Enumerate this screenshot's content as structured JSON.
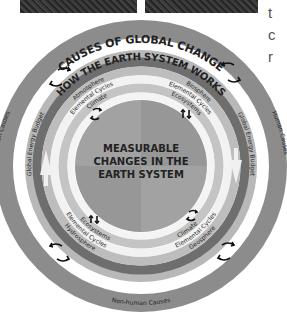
{
  "photos": [
    {
      "name": "photo-left"
    },
    {
      "name": "photo-right"
    }
  ],
  "side_text": [
    "t",
    "c",
    "r"
  ],
  "diagram": {
    "outer_ring_title": "CAUSES OF GLOBAL CHANGE",
    "outer_left": "Human Causes",
    "outer_right": "Human Causes",
    "outer_bottom": "Non-human Causes",
    "middle_title": "HOW THE EARTH SYSTEM WORKS",
    "global_energy_left": "Global Energy Budget",
    "global_energy_right": "Global Energy Budget",
    "sphere_top_left": "Atmosphere",
    "sphere_top_right": "Biosphere",
    "sphere_bottom_left": "Hydrosphere",
    "sphere_bottom_right": "Geosphere",
    "cycles_top_left": "Elemental Cycles",
    "cycles_top_right": "Elemental Cycles",
    "cycles_bottom_left": "Elemental Cycles",
    "cycles_bottom_right": "Elemental Cycles",
    "inner_top_left": "Climate",
    "inner_top_right": "Ecosystems",
    "inner_bottom_left": "Ecosystems",
    "inner_bottom_right": "Climate",
    "center_line1": "MEASURABLE",
    "center_line2": "CHANGES IN THE",
    "center_line3": "EARTH SYSTEM"
  },
  "colors": {
    "outer_ring": "#8c8c8c",
    "band_light": "#b4b4b4",
    "band_dark": "#6a6a6a",
    "band_mid": "#c6c6c6",
    "center_a": "#9a9a9a",
    "center_b": "#a6a6a6"
  }
}
